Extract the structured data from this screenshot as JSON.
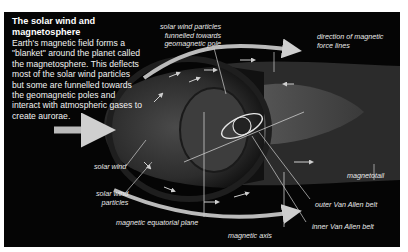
{
  "intro": {
    "title": "The solar wind and magnetosphere",
    "body": "Earth's magnetic field forms a \"blanket\" around the planet called the magnetosphere. This deflects most of the solar wind particles but some are funnelled towards the geomagnetic poles and interact with atmospheric gases to create aurorae."
  },
  "labels": {
    "funnelled_line1": "solar wind particles",
    "funnelled_line2": "funnelled towards",
    "funnelled_line3": "geomagnetic pole",
    "force_lines_line1": "direction of magnetic",
    "force_lines_line2": "force lines",
    "solar_wind": "solar wind",
    "particles_line1": "solar wind",
    "particles_line2": "particles",
    "magnetotail": "magnetotail",
    "outer_belt": "outer Van Allen belt",
    "inner_belt": "inner Van Allen belt",
    "equatorial_plane": "magnetic equatorial plane",
    "magnetic_axis": "magnetic axis"
  },
  "colors": {
    "background": "#050505",
    "border": "#ffffff",
    "text": "#f2f2f2",
    "arrows": "#bdbdbd",
    "magnetosphere": "#3a3a3a",
    "tail": "#555555"
  }
}
